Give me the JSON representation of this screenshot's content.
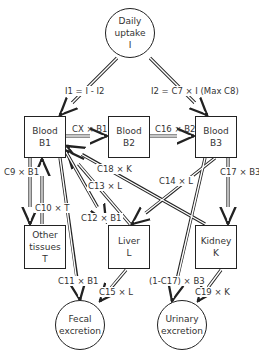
{
  "nodes": {
    "uptake": {
      "line1": "Daily",
      "line2": "uptake",
      "line3": "I"
    },
    "b1": {
      "line1": "Blood",
      "line2": "B1"
    },
    "b2": {
      "line1": "Blood",
      "line2": "B2"
    },
    "b3": {
      "line1": "Blood",
      "line2": "B3"
    },
    "tissues": {
      "line1": "Other",
      "line2": "tissues",
      "line3": "T"
    },
    "liver": {
      "line1": "Liver",
      "line2": "L"
    },
    "kidney": {
      "line1": "Kidney",
      "line2": "K"
    },
    "fecal": {
      "line1": "Fecal",
      "line2": "excretion"
    },
    "urinary": {
      "line1": "Urinary",
      "line2": "excretion"
    }
  },
  "flows": {
    "i1": "I1 = I - I2",
    "i2": "I2 = C7 × I (Max C8)",
    "cx": "CX × B1",
    "c16": "C16 × B2",
    "c9": "C9 × B1",
    "c10": "C10 × T",
    "c18": "C18 × K",
    "c13": "C13 × L",
    "c14": "C14 × L",
    "c12": "C12 × B1",
    "c17": "C17 × B3",
    "c11": "C11 × B1",
    "c15": "C15 × L",
    "urin": "(1-C17) × B3",
    "c19": "C19 × K"
  }
}
